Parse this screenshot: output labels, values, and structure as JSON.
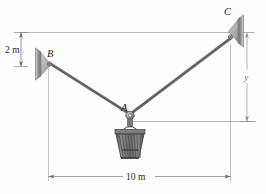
{
  "figure": {
    "background_color": "#fdfdfd",
    "points": {
      "A": {
        "label": "A",
        "role": "basket-attachment-ring"
      },
      "B": {
        "label": "B",
        "role": "left-wall-bracket"
      },
      "C": {
        "label": "C",
        "role": "right-wall-bracket"
      }
    },
    "dimensions": {
      "vertical_left": {
        "label": "2 m",
        "value": 2,
        "unit": "m",
        "description": "vertical offset from C level down to B"
      },
      "horizontal_bottom": {
        "label": "10 m",
        "value": 10,
        "unit": "m",
        "description": "horizontal span from B to C"
      },
      "vertical_right": {
        "label": "y",
        "value": null,
        "unit": "m",
        "description": "unknown vertical drop from C level to A"
      }
    },
    "members": [
      {
        "name": "cable-BA",
        "from": "B",
        "to": "A"
      },
      {
        "name": "cable-AC",
        "from": "A",
        "to": "C"
      }
    ],
    "colors": {
      "cable": "#6f6f6f",
      "dimension_line": "#8a8a8a",
      "bracket_plate": "#8c8c8c",
      "bracket_gusset": "#b8b8b8",
      "basket": "#585858",
      "text": "#2b2b2b"
    }
  }
}
